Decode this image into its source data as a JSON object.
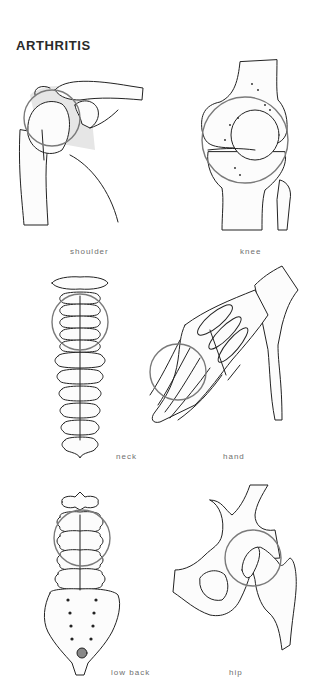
{
  "page": {
    "title": "ARTHRITIS"
  },
  "figures": [
    {
      "id": "shoulder",
      "label": "shoulder"
    },
    {
      "id": "knee",
      "label": "knee"
    },
    {
      "id": "neck",
      "label": "neck"
    },
    {
      "id": "hand",
      "label": "hand"
    },
    {
      "id": "low-back",
      "label": "low back"
    },
    {
      "id": "hip",
      "label": "hip"
    }
  ],
  "colors": {
    "title": "#2a2a2a",
    "label": "#6f6f6f",
    "highlight_ring": "#7a7a7a",
    "line_art": "#222222",
    "background": "#ffffff"
  }
}
